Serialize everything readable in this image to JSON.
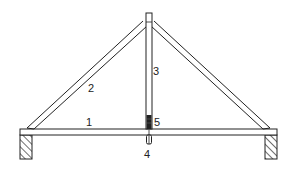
{
  "diagram": {
    "labels": {
      "tie_beam": "1",
      "rafter": "2",
      "king_post": "3",
      "bolt": "4",
      "strap": "5"
    },
    "colors": {
      "line": "#222222",
      "background": "#ffffff"
    }
  }
}
